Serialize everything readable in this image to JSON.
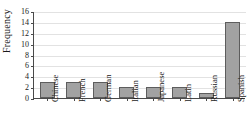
{
  "chart_data": {
    "type": "bar",
    "title": "",
    "xlabel": "",
    "ylabel": "Frequency",
    "categories": [
      "Chinese",
      "French",
      "German",
      "Italian",
      "Japanese",
      "Latin",
      "Russian",
      "Spanish"
    ],
    "values": [
      3,
      3,
      3,
      2,
      2,
      2,
      1,
      14
    ],
    "ylim": [
      0,
      16
    ],
    "ytick_labels": [
      "0",
      "2",
      "4",
      "6",
      "8",
      "10",
      "12",
      "14",
      "16"
    ],
    "ytick_values": [
      0,
      2,
      4,
      6,
      8,
      10,
      12,
      14,
      16
    ],
    "grid": "horizontal",
    "legend": "none",
    "orientation": "vertical",
    "xlabel_rotation": 90,
    "colors": {
      "bar_fill": "#a2a2a2",
      "bar_border": "#5d5d5d",
      "gridline": "#e2e2e2",
      "axis": "#4a4a4a",
      "text": "#1a1a1a",
      "background": "#ffffff"
    }
  }
}
